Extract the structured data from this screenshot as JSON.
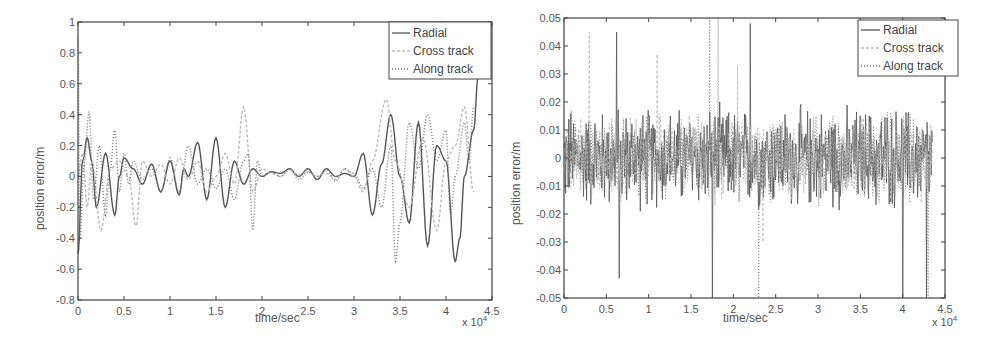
{
  "chart_data": [
    {
      "type": "line",
      "title": "",
      "xlabel": "time/sec",
      "ylabel": "position error/m",
      "x_multiplier_label": "x 10",
      "x_multiplier_exp": "4",
      "xlim": [
        0,
        4.5
      ],
      "ylim": [
        -0.8,
        1
      ],
      "xticks": [
        0,
        0.5,
        1,
        1.5,
        2,
        2.5,
        3,
        3.5,
        4,
        4.5
      ],
      "xtick_labels": [
        "0",
        "0.5",
        "1",
        "1.5",
        "2",
        "2.5",
        "3",
        "3.5",
        "4",
        "4.5"
      ],
      "yticks": [
        -0.8,
        -0.6,
        -0.4,
        -0.2,
        0,
        0.2,
        0.4,
        0.6,
        0.8,
        1
      ],
      "ytick_labels": [
        "-0.8",
        "-0.6",
        "-0.4",
        "-0.2",
        "0",
        "0.2",
        "0.4",
        "0.6",
        "0.8",
        "1"
      ],
      "grid": false,
      "legend_position": "upper right",
      "series": [
        {
          "name": "Radial",
          "style": "solid",
          "color": "#555555",
          "x": [
            0,
            0.05,
            0.1,
            0.15,
            0.2,
            0.3,
            0.4,
            0.45,
            0.5,
            0.6,
            0.7,
            0.8,
            0.9,
            1.0,
            1.1,
            1.15,
            1.2,
            1.3,
            1.4,
            1.5,
            1.6,
            1.7,
            1.8,
            1.9,
            2.0,
            2.1,
            2.2,
            2.3,
            2.4,
            2.5,
            2.6,
            2.7,
            2.8,
            2.9,
            3.0,
            3.1,
            3.2,
            3.3,
            3.4,
            3.5,
            3.6,
            3.7,
            3.8,
            3.9,
            4.0,
            4.1,
            4.15,
            4.2,
            4.3,
            4.35
          ],
          "y": [
            -0.5,
            0.1,
            0.25,
            0.1,
            -0.2,
            0.15,
            -0.25,
            0.0,
            0.12,
            0.05,
            -0.05,
            0.08,
            -0.1,
            0.1,
            -0.12,
            0.05,
            0.0,
            0.22,
            -0.15,
            0.25,
            -0.2,
            0.1,
            -0.05,
            0.05,
            0.0,
            0.03,
            0.02,
            0.05,
            0.0,
            0.05,
            -0.02,
            0.05,
            0.0,
            0.02,
            0.0,
            0.15,
            -0.25,
            0.08,
            0.4,
            0.0,
            -0.3,
            0.35,
            -0.45,
            0.2,
            0.1,
            -0.55,
            -0.4,
            0.0,
            0.3,
            0.65
          ]
        },
        {
          "name": "Cross track",
          "style": "dashed",
          "color": "#bbbbbb",
          "x": [
            0,
            0.05,
            0.1,
            0.15,
            0.25,
            0.35,
            0.45,
            0.55,
            0.63,
            0.7,
            0.8,
            0.9,
            1.0,
            1.1,
            1.2,
            1.3,
            1.4,
            1.5,
            1.6,
            1.7,
            1.8,
            1.9,
            2.0,
            2.1,
            2.2,
            2.3,
            2.4,
            2.5,
            2.6,
            2.7,
            2.8,
            2.9,
            3.0,
            3.1,
            3.2,
            3.35,
            3.45,
            3.6,
            3.75,
            3.9,
            4.0,
            4.1,
            4.2,
            4.3
          ],
          "y": [
            0.0,
            0.15,
            -0.2,
            0.1,
            -0.35,
            0.05,
            0.1,
            0.0,
            -0.32,
            0.1,
            0.0,
            0.08,
            -0.05,
            0.12,
            -0.02,
            0.1,
            -0.1,
            0.0,
            0.15,
            -0.05,
            0.45,
            -0.1,
            0.05,
            0.02,
            0.0,
            0.04,
            0.01,
            0.03,
            0.0,
            0.02,
            -0.02,
            0.05,
            0.0,
            -0.1,
            0.1,
            0.5,
            0.1,
            -0.2,
            0.25,
            -0.35,
            0.1,
            0.2,
            0.45,
            -0.1
          ]
        },
        {
          "name": "Along track",
          "style": "dotted",
          "color": "#777777",
          "x": [
            0,
            0.02,
            0.07,
            0.12,
            0.17,
            0.23,
            0.3,
            0.35,
            0.4,
            0.45,
            0.5,
            0.55,
            0.6,
            0.7,
            0.8,
            0.9,
            1.0,
            1.1,
            1.2,
            1.3,
            1.4,
            1.5,
            1.6,
            1.7,
            1.8,
            1.85,
            1.9,
            1.95,
            2.0,
            2.1,
            2.2,
            2.3,
            2.4,
            2.5,
            2.6,
            2.7,
            2.8,
            2.9,
            3.0,
            3.1,
            3.2,
            3.3,
            3.4,
            3.45,
            3.5,
            3.6,
            3.7,
            3.8,
            3.9,
            4.0,
            4.05,
            4.1,
            4.2,
            4.25,
            4.3
          ],
          "y": [
            0.9,
            -0.4,
            0.1,
            0.42,
            -0.15,
            0.2,
            -0.25,
            0.05,
            0.3,
            -0.1,
            0.15,
            -0.05,
            0.1,
            -0.02,
            0.05,
            -0.1,
            0.12,
            -0.1,
            0.2,
            -0.05,
            0.05,
            -0.08,
            0.05,
            -0.15,
            0.1,
            0.15,
            -0.35,
            0.1,
            0.0,
            0.03,
            0.0,
            0.05,
            -0.02,
            0.03,
            0.0,
            0.04,
            -0.03,
            0.05,
            0.02,
            -0.08,
            0.05,
            -0.2,
            0.2,
            -0.55,
            -0.3,
            0.35,
            0.05,
            0.4,
            0.1,
            0.3,
            -0.25,
            0.0,
            0.35,
            0.1,
            0.45
          ]
        }
      ]
    },
    {
      "type": "line",
      "title": "",
      "xlabel": "time/sec",
      "ylabel": "position error/m",
      "x_multiplier_label": "x 10",
      "x_multiplier_exp": "4",
      "xlim": [
        0,
        4.5
      ],
      "ylim": [
        -0.05,
        0.05
      ],
      "xticks": [
        0,
        0.5,
        1,
        1.5,
        2,
        2.5,
        3,
        3.5,
        4,
        4.5
      ],
      "xtick_labels": [
        "0",
        "0.5",
        "1",
        "1.5",
        "2",
        "2.5",
        "3",
        "3.5",
        "4",
        "4.5"
      ],
      "yticks": [
        -0.05,
        -0.04,
        -0.03,
        -0.02,
        -0.01,
        0,
        0.01,
        0.02,
        0.03,
        0.04,
        0.05
      ],
      "ytick_labels": [
        "-0.05",
        "-0.04",
        "-0.03",
        "-0.02",
        "-0.01",
        "0",
        "0.01",
        "0.02",
        "0.03",
        "0.04",
        "0.05"
      ],
      "grid": false,
      "legend_position": "upper right",
      "notes": "High-frequency noise-like error mostly within ±0.02 m; occasional spikes reach ±0.05 m near t≈1.75e4, 2.3e4, 4.0e4, 4.3e4 s.",
      "series": [
        {
          "name": "Radial",
          "style": "solid",
          "color": "#555555",
          "amplitude_typical": 0.015,
          "spikes": [
            [
              0.62,
              0.045
            ],
            [
              0.65,
              -0.043
            ],
            [
              1.75,
              0.05
            ],
            [
              1.75,
              -0.05
            ],
            [
              2.2,
              0.048
            ],
            [
              4.0,
              -0.05
            ],
            [
              4.28,
              -0.05
            ]
          ]
        },
        {
          "name": "Cross track",
          "style": "dashed",
          "color": "#bbbbbb",
          "amplitude_typical": 0.012,
          "spikes": [
            [
              0.3,
              0.045
            ],
            [
              1.1,
              0.037
            ],
            [
              2.05,
              0.033
            ],
            [
              2.35,
              -0.03
            ]
          ]
        },
        {
          "name": "Along track",
          "style": "dotted",
          "color": "#777777",
          "amplitude_typical": 0.013,
          "spikes": [
            [
              1.72,
              0.05
            ],
            [
              1.82,
              0.05
            ],
            [
              2.3,
              -0.05
            ],
            [
              4.3,
              -0.05
            ]
          ]
        }
      ]
    }
  ],
  "panels": [
    {
      "legend": [
        {
          "label": "Radial"
        },
        {
          "label": "Cross track"
        },
        {
          "label": "Along track"
        }
      ]
    },
    {
      "legend": [
        {
          "label": "Radial"
        },
        {
          "label": "Cross track"
        },
        {
          "label": "Along track"
        }
      ]
    }
  ]
}
